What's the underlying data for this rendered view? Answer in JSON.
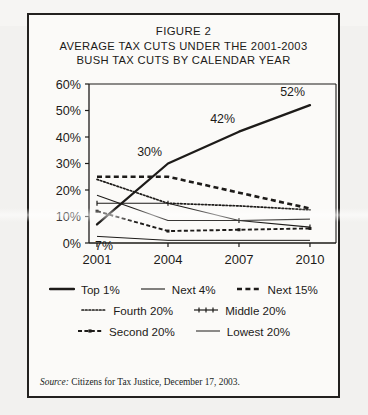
{
  "figure": {
    "title_lines": [
      "FIGURE 2",
      "AVERAGE TAX CUTS UNDER THE 2001-2003",
      "BUSH TAX CUTS BY CALENDAR YEAR"
    ],
    "source_prefix": "Source:",
    "source_text": " Citizens for Tax Justice, December 17, 2003."
  },
  "chart_data": {
    "type": "line",
    "title": "AVERAGE TAX CUTS UNDER THE 2001-2003 BUSH TAX CUTS BY CALENDAR YEAR",
    "xlabel": "",
    "ylabel": "",
    "x": [
      "2001",
      "2004",
      "2007",
      "2010"
    ],
    "categories": [
      "2001",
      "2004",
      "2007",
      "2010"
    ],
    "ylim": [
      0,
      60
    ],
    "ytick_values": [
      0,
      10,
      20,
      30,
      40,
      50,
      60
    ],
    "ytick_labels": [
      "0%",
      "10%",
      "20%",
      "30%",
      "40%",
      "50%",
      "60%"
    ],
    "grid": false,
    "legend_position": "bottom",
    "annotations": [
      {
        "text": "7%",
        "series": "Top 1%",
        "x": "2001",
        "value": 7
      },
      {
        "text": "30%",
        "series": "Top 1%",
        "x": "2004",
        "value": 30
      },
      {
        "text": "42%",
        "series": "Top 1%",
        "x": "2007",
        "value": 42
      },
      {
        "text": "52%",
        "series": "Top 1%",
        "x": "2010",
        "value": 52
      }
    ],
    "series": [
      {
        "name": "Top 1%",
        "style": "solid-thick",
        "values": [
          7,
          30,
          42,
          52
        ]
      },
      {
        "name": "Next 4%",
        "style": "solid-thin",
        "values": [
          18,
          8.5,
          8.5,
          9
        ]
      },
      {
        "name": "Next 15%",
        "style": "dashed-bold",
        "values": [
          25,
          25,
          19,
          13
        ]
      },
      {
        "name": "Fourth 20%",
        "style": "dotted-fine",
        "values": [
          24,
          15,
          14,
          12.5
        ]
      },
      {
        "name": "Middle 20%",
        "style": "solid-marker",
        "values": [
          15,
          15,
          8.5,
          6
        ]
      },
      {
        "name": "Second 20%",
        "style": "dashdot",
        "values": [
          12,
          4.5,
          5,
          5.5
        ]
      },
      {
        "name": "Lowest 20%",
        "style": "solid-light",
        "values": [
          2.5,
          1,
          1,
          1
        ]
      }
    ]
  },
  "legend": {
    "rows": [
      [
        {
          "label": "Top 1%",
          "marker": "solid-thick"
        },
        {
          "label": "Next 4%",
          "marker": "solid-thin"
        },
        {
          "label": "Next 15%",
          "marker": "dashed-bold"
        }
      ],
      [
        {
          "label": "Fourth 20%",
          "marker": "dotted-fine"
        },
        {
          "label": "Middle 20%",
          "marker": "solid-marker"
        }
      ],
      [
        {
          "label": "Second 20%",
          "marker": "dashdot"
        },
        {
          "label": "Lowest 20%",
          "marker": "solid-light"
        }
      ]
    ]
  },
  "colors": {
    "ink": "#1d1b19",
    "paper": "#fbfaf8",
    "border": "#23211f"
  }
}
